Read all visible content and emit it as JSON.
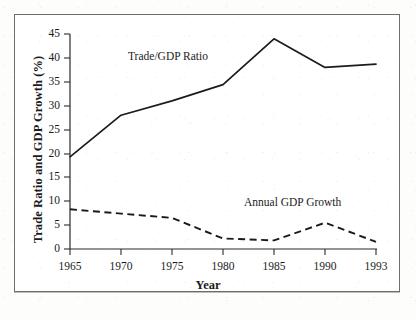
{
  "figure": {
    "background_color": "#ffffff",
    "frame_color": "#6e6e6e",
    "ink_color": "#1b1b1b"
  },
  "chart_data": {
    "type": "line",
    "title": "",
    "xlabel": "Year",
    "ylabel": "Trade Ratio and GDP Growth (%)",
    "x": [
      1965,
      1970,
      1975,
      1980,
      1985,
      1990,
      1993
    ],
    "categories": [
      "1965",
      "1970",
      "1975",
      "1980",
      "1985",
      "1990",
      "1993"
    ],
    "xlim": [
      1965,
      1993
    ],
    "ylim": [
      0,
      45
    ],
    "yticks": [
      0,
      5,
      10,
      15,
      20,
      25,
      30,
      35,
      40,
      45
    ],
    "ytick_labels": [
      "0",
      "5",
      "10",
      "15",
      "20",
      "25",
      "30",
      "35",
      "40",
      "45"
    ],
    "xtick_labels": [
      "1965",
      "1970",
      "1975",
      "1980",
      "1985",
      "1990",
      "1993"
    ],
    "grid": false,
    "legend_position": "inline-annotation",
    "series": [
      {
        "name": "Trade/GDP Ratio",
        "style": "solid",
        "color": "#1b1b1b",
        "values": [
          19.3,
          28.0,
          31.0,
          34.4,
          44.0,
          38.0,
          38.7
        ]
      },
      {
        "name": "Annual GDP Growth",
        "style": "dashed",
        "color": "#1b1b1b",
        "values": [
          8.3,
          7.4,
          6.5,
          2.2,
          1.8,
          5.5,
          1.5
        ]
      }
    ],
    "annotations": [
      {
        "text": "Trade/GDP Ratio",
        "x_px": 128,
        "y_px": 57
      },
      {
        "text": "Annual GDP Growth",
        "x_px": 244,
        "y_px": 203
      }
    ]
  }
}
